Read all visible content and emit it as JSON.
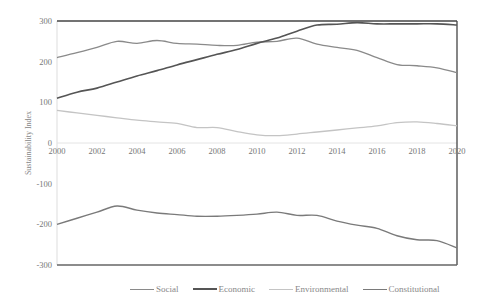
{
  "chart_data": {
    "type": "line",
    "title": "",
    "xlabel": "",
    "ylabel": "Sustainability Index",
    "x": [
      2000,
      2001,
      2002,
      2003,
      2004,
      2005,
      2006,
      2007,
      2008,
      2009,
      2010,
      2011,
      2012,
      2013,
      2014,
      2015,
      2016,
      2017,
      2018,
      2019,
      2020
    ],
    "x_ticks": [
      "2000",
      "2002",
      "2004",
      "2006",
      "2008",
      "2010",
      "2012",
      "2014",
      "2016",
      "2018",
      "2020"
    ],
    "y_ticks": [
      "300",
      "200",
      "100",
      "0",
      "-100",
      "-200",
      "-300"
    ],
    "ylim": [
      -300,
      300
    ],
    "xlim": [
      2000,
      2020
    ],
    "grid": false,
    "legend_position": "bottom",
    "series": [
      {
        "name": "Social",
        "color": "#8a8a8a",
        "width": 1.3,
        "values": [
          210,
          222,
          235,
          250,
          245,
          252,
          245,
          243,
          240,
          240,
          248,
          250,
          258,
          243,
          235,
          228,
          210,
          193,
          190,
          185,
          173
        ]
      },
      {
        "name": "Economic",
        "color": "#555555",
        "width": 1.6,
        "values": [
          110,
          125,
          135,
          150,
          165,
          178,
          192,
          205,
          218,
          230,
          245,
          258,
          275,
          290,
          292,
          296,
          293,
          293,
          293,
          293,
          290
        ]
      },
      {
        "name": "Environmental",
        "color": "#c4c4c4",
        "width": 1.3,
        "values": [
          80,
          74,
          68,
          62,
          56,
          52,
          48,
          38,
          38,
          28,
          20,
          18,
          22,
          27,
          32,
          37,
          42,
          50,
          52,
          48,
          42
        ]
      },
      {
        "name": "Constitutional",
        "color": "#7a7a7a",
        "width": 1.4,
        "values": [
          -200,
          -185,
          -170,
          -155,
          -165,
          -172,
          -176,
          -180,
          -180,
          -178,
          -175,
          -170,
          -178,
          -178,
          -192,
          -202,
          -210,
          -228,
          -238,
          -240,
          -258
        ]
      }
    ]
  },
  "legend": {
    "items": [
      {
        "label": "Social",
        "color": "#8a8a8a"
      },
      {
        "label": "Economic",
        "color": "#555555"
      },
      {
        "label": "Environmental",
        "color": "#c4c4c4"
      },
      {
        "label": "Constitutional",
        "color": "#7a7a7a"
      }
    ]
  }
}
